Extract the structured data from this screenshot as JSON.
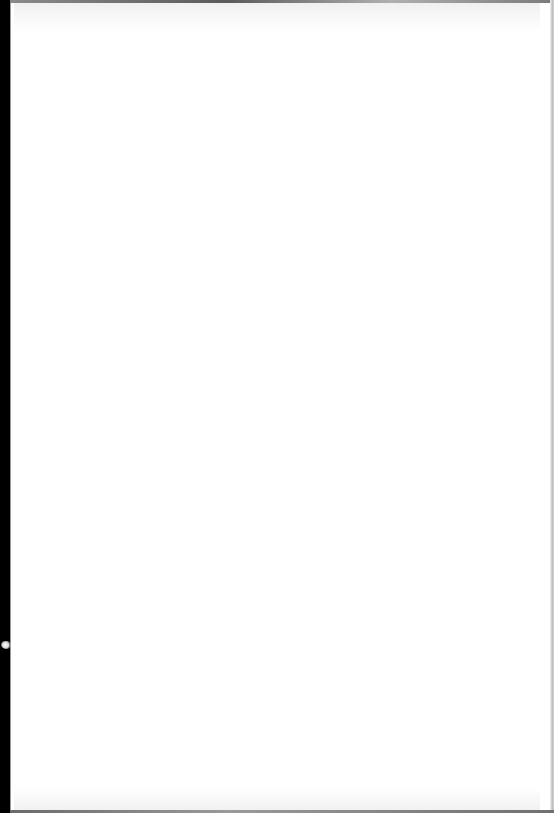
{
  "document": {
    "page_type": "blank scanned page",
    "text": "",
    "colors": {
      "page": "#ffffff",
      "left_margin": "#000000",
      "edge_shadow": "#9a9a9a"
    }
  }
}
